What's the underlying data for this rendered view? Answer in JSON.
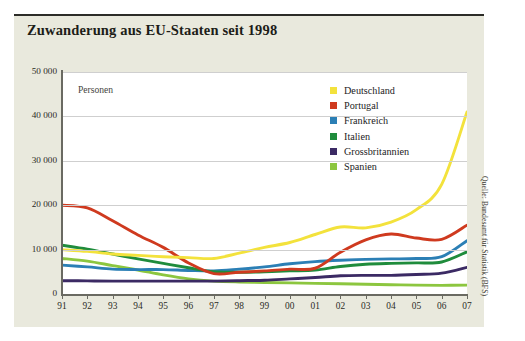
{
  "chart_data": {
    "type": "line",
    "title": "Zuwanderung aus EU-Staaten seit 1998",
    "xlabel": "",
    "ylabel": "Personen",
    "axis_note": "Personen",
    "source": "Quelle: Bundesamt für Statistik (BFS)",
    "x": [
      "91",
      "92",
      "93",
      "94",
      "95",
      "96",
      "97",
      "98",
      "99",
      "00",
      "01",
      "02",
      "03",
      "04",
      "05",
      "06",
      "07"
    ],
    "xlim": [
      0,
      16
    ],
    "ylim": [
      0,
      50000
    ],
    "yticks": [
      0,
      10000,
      20000,
      30000,
      40000,
      50000
    ],
    "ytick_labels": [
      "0",
      "10 000",
      "20 000",
      "30 000",
      "40 000",
      "50 000"
    ],
    "grid": true,
    "legend_position": "top-right",
    "series": [
      {
        "name": "Deutschland",
        "color": "#f3e23c",
        "values": [
          10000,
          9600,
          9000,
          8700,
          8400,
          8200,
          8000,
          9200,
          10500,
          11600,
          13400,
          15100,
          14900,
          16200,
          19000,
          24700,
          41000
        ]
      },
      {
        "name": "Portugal",
        "color": "#cf3a1f",
        "values": [
          20000,
          19400,
          16500,
          13300,
          10500,
          7000,
          4600,
          4900,
          5200,
          5600,
          5800,
          9400,
          12200,
          13500,
          12600,
          12300,
          15500
        ]
      },
      {
        "name": "Frankreich",
        "color": "#2b7fb5",
        "values": [
          6500,
          6100,
          5600,
          5500,
          5500,
          5300,
          5200,
          5600,
          6100,
          6800,
          7300,
          7600,
          7800,
          7900,
          8000,
          8400,
          12000
        ]
      },
      {
        "name": "Italien",
        "color": "#1f8c3c",
        "values": [
          11000,
          10100,
          9000,
          7900,
          6900,
          5900,
          5000,
          4900,
          5000,
          5200,
          5400,
          6200,
          6700,
          6900,
          7000,
          7200,
          9500
        ]
      },
      {
        "name": "Grossbritannien",
        "color": "#3b2a64",
        "values": [
          3000,
          2950,
          2900,
          2900,
          2900,
          2900,
          2900,
          3000,
          3100,
          3400,
          3700,
          4100,
          4200,
          4200,
          4400,
          4700,
          6000
        ]
      },
      {
        "name": "Spanien",
        "color": "#8cc63f",
        "values": [
          8000,
          7400,
          6400,
          5400,
          4300,
          3400,
          2900,
          2700,
          2600,
          2500,
          2400,
          2300,
          2200,
          2100,
          2000,
          1950,
          2000
        ]
      }
    ]
  }
}
